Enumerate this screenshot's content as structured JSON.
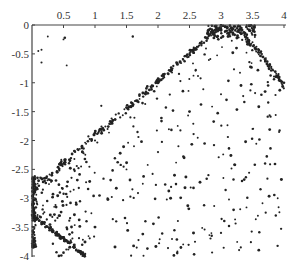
{
  "chart_data": {
    "type": "scatter",
    "title": "",
    "xlabel": "",
    "ylabel": "",
    "xlim": [
      0,
      4
    ],
    "ylim": [
      -4,
      0
    ],
    "x_axis_position": "top",
    "grid": false,
    "legend": null,
    "x_ticks": [
      0.5,
      1,
      1.5,
      2,
      2.5,
      3,
      3.5,
      4
    ],
    "x_tick_labels": [
      "0.5",
      "1",
      "1.5",
      "2",
      "2.5",
      "3",
      "3.5",
      "4"
    ],
    "y_ticks": [
      0,
      -0.5,
      -1,
      -1.5,
      -2,
      -2.5,
      -3,
      -3.5,
      -4
    ],
    "y_tick_labels": [
      "0",
      "-0.5",
      "-1",
      "-1.5",
      "-2",
      "-2.5",
      "-3",
      "-3.5",
      "-4"
    ],
    "marker_color": "#222222",
    "axis_color": "#444444",
    "series": [
      {
        "name": "points",
        "points": [
          [
            0.25,
            -0.2
          ],
          [
            0.5,
            -0.25
          ],
          [
            0.52,
            -0.22
          ],
          [
            0.1,
            -0.45
          ],
          [
            0.15,
            -0.43
          ],
          [
            0.15,
            -0.65
          ],
          [
            0.55,
            -0.7
          ],
          [
            1.6,
            -0.2
          ],
          [
            1.1,
            -1.4
          ],
          [
            0.05,
            -2.8
          ],
          [
            0.2,
            -2.7
          ],
          [
            0.4,
            -2.55
          ],
          [
            0.6,
            -2.35
          ],
          [
            0.8,
            -2.2
          ],
          [
            1.0,
            -2.0
          ],
          [
            1.2,
            -1.8
          ],
          [
            1.4,
            -1.6
          ],
          [
            1.6,
            -1.4
          ],
          [
            1.8,
            -1.2
          ],
          [
            2.0,
            -1.0
          ],
          [
            2.2,
            -0.8
          ],
          [
            2.4,
            -0.6
          ],
          [
            2.6,
            -0.4
          ],
          [
            2.8,
            -0.2
          ],
          [
            3.0,
            -0.05
          ],
          [
            0.05,
            -3.3
          ],
          [
            0.2,
            -3.45
          ],
          [
            0.4,
            -3.65
          ],
          [
            0.6,
            -3.85
          ],
          [
            0.8,
            -4.0
          ],
          [
            0.02,
            -2.7
          ],
          [
            0.02,
            -3.0
          ],
          [
            0.02,
            -3.2
          ],
          [
            0.02,
            -3.5
          ],
          [
            0.02,
            -3.75
          ],
          [
            2.9,
            -0.02
          ],
          [
            3.0,
            -0.1
          ],
          [
            3.1,
            -0.05
          ],
          [
            3.2,
            -0.15
          ],
          [
            3.3,
            -0.02
          ],
          [
            3.4,
            -0.2
          ],
          [
            3.5,
            -0.3
          ],
          [
            3.6,
            -0.45
          ],
          [
            3.7,
            -0.6
          ],
          [
            3.8,
            -0.75
          ],
          [
            3.9,
            -0.9
          ],
          [
            4.0,
            -1.0
          ],
          [
            1.5,
            -2.5
          ],
          [
            2.0,
            -2.2
          ],
          [
            2.5,
            -1.5
          ],
          [
            3.0,
            -1.2
          ],
          [
            3.5,
            -1.8
          ],
          [
            2.2,
            -3.0
          ],
          [
            2.8,
            -2.6
          ],
          [
            3.2,
            -3.2
          ],
          [
            3.7,
            -2.4
          ],
          [
            1.8,
            -3.4
          ],
          [
            2.4,
            -3.8
          ],
          [
            3.0,
            -3.6
          ],
          [
            3.6,
            -3.9
          ],
          [
            1.2,
            -3.0
          ],
          [
            1.0,
            -3.5
          ],
          [
            3.9,
            -3.0
          ]
        ]
      }
    ]
  }
}
